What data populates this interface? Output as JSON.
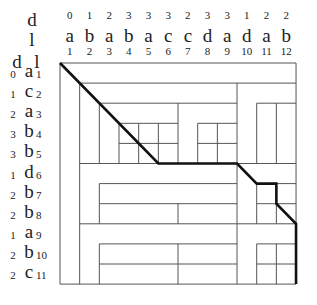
{
  "top_header": {
    "d_label": "d",
    "l_label": "l"
  },
  "left_header": {
    "d_label": "d",
    "l_label": "l"
  },
  "columns": [
    {
      "d": "0",
      "letter": "a",
      "index": "1"
    },
    {
      "d": "1",
      "letter": "b",
      "index": "2"
    },
    {
      "d": "2",
      "letter": "a",
      "index": "3"
    },
    {
      "d": "3",
      "letter": "b",
      "index": "4"
    },
    {
      "d": "3",
      "letter": "a",
      "index": "5"
    },
    {
      "d": "3",
      "letter": "c",
      "index": "6"
    },
    {
      "d": "2",
      "letter": "c",
      "index": "7"
    },
    {
      "d": "3",
      "letter": "d",
      "index": "8"
    },
    {
      "d": "3",
      "letter": "a",
      "index": "9"
    },
    {
      "d": "1",
      "letter": "d",
      "index": "10"
    },
    {
      "d": "2",
      "letter": "a",
      "index": "11"
    },
    {
      "d": "2",
      "letter": "b",
      "index": "12"
    }
  ],
  "rows": [
    {
      "d": "0",
      "letter": "a",
      "index": "1"
    },
    {
      "d": "1",
      "letter": "c",
      "index": "2"
    },
    {
      "d": "2",
      "letter": "a",
      "index": "3"
    },
    {
      "d": "3",
      "letter": "b",
      "index": "4"
    },
    {
      "d": "3",
      "letter": "b",
      "index": "5"
    },
    {
      "d": "1",
      "letter": "d",
      "index": "6"
    },
    {
      "d": "2",
      "letter": "b",
      "index": "7"
    },
    {
      "d": "2",
      "letter": "b",
      "index": "8"
    },
    {
      "d": "1",
      "letter": "a",
      "index": "9"
    },
    {
      "d": "2",
      "letter": "b",
      "index": "10"
    },
    {
      "d": "2",
      "letter": "c",
      "index": "11"
    }
  ],
  "grid": {
    "left": 60,
    "top": 63,
    "col_width": 19.67,
    "row_height": 20.1,
    "n_cols": 12,
    "n_rows": 11,
    "line_color": "#555555",
    "path_color": "#111111",
    "thin_segments": [
      [
        0,
        0,
        12,
        0
      ],
      [
        12,
        0,
        12,
        11
      ],
      [
        12,
        11,
        0,
        11
      ],
      [
        0,
        11,
        0,
        0
      ],
      [
        1,
        1,
        12,
        1
      ],
      [
        1,
        1,
        1,
        11
      ],
      [
        2,
        2,
        9,
        2
      ],
      [
        10,
        2,
        12,
        2
      ],
      [
        2,
        2,
        2,
        5
      ],
      [
        9,
        1,
        9,
        5
      ],
      [
        6,
        2,
        6,
        5
      ],
      [
        3,
        3,
        6,
        3
      ],
      [
        3,
        4,
        6,
        4
      ],
      [
        3,
        3,
        3,
        5
      ],
      [
        4,
        3,
        4,
        5
      ],
      [
        5,
        3,
        5,
        5
      ],
      [
        7,
        3,
        9,
        3
      ],
      [
        7,
        4,
        9,
        4
      ],
      [
        7,
        3,
        7,
        5
      ],
      [
        8,
        3,
        8,
        5
      ],
      [
        10,
        2,
        10,
        5
      ],
      [
        11,
        2,
        11,
        5
      ],
      [
        1,
        5,
        12,
        5
      ],
      [
        9,
        5,
        9,
        11
      ],
      [
        2,
        6,
        9,
        6
      ],
      [
        10,
        6,
        12,
        6
      ],
      [
        2,
        6,
        2,
        8
      ],
      [
        2,
        7,
        9,
        7
      ],
      [
        10,
        7,
        12,
        7
      ],
      [
        6,
        7,
        6,
        8
      ],
      [
        10,
        6,
        10,
        8
      ],
      [
        11,
        6,
        11,
        8
      ],
      [
        1,
        8,
        12,
        8
      ],
      [
        2,
        9,
        9,
        9
      ],
      [
        10,
        9,
        12,
        9
      ],
      [
        2,
        9,
        2,
        11
      ],
      [
        2,
        10,
        9,
        10
      ],
      [
        10,
        10,
        12,
        10
      ],
      [
        6,
        9,
        6,
        11
      ],
      [
        10,
        9,
        10,
        11
      ],
      [
        11,
        9,
        11,
        11
      ]
    ],
    "path": [
      [
        0,
        0
      ],
      [
        5,
        5
      ],
      [
        9,
        5
      ],
      [
        10,
        6
      ],
      [
        11,
        6
      ],
      [
        11,
        7
      ],
      [
        12,
        8
      ],
      [
        12,
        11
      ]
    ]
  }
}
